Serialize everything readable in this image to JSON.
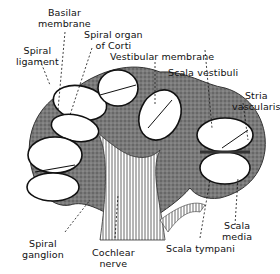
{
  "colors": {
    "background": "#ffffff",
    "ink": "#111111",
    "tissue": "#6e6e6e",
    "tissue_dark": "#3e3e3e",
    "duct_fill": "#ffffff"
  },
  "labels": {
    "basilar_membrane": "Basilar\nmembrane",
    "spiral_organ": "Spiral organ\nof Corti",
    "spiral_ligament": "Spiral\nligament",
    "vestibular_membrane": "Vestibular membrane",
    "scala_vestibuli": "Scala vestibuli",
    "stria_vascularis": "Stria\nvascularis",
    "spiral_ganglion": "Spiral\nganglion",
    "cochlear_nerve": "Cochlear\nnerve",
    "scala_tympani": "Scala tympani",
    "scala_media": "Scala\nmedia"
  }
}
